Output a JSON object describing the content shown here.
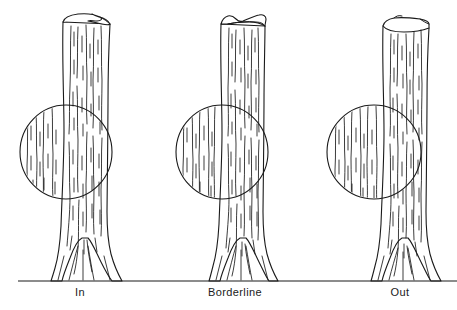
{
  "figure": {
    "background_color": "#ffffff",
    "ink_color": "#1a1a1a",
    "width": 457,
    "height": 310
  },
  "ground": {
    "name": "ground-line",
    "y": 281,
    "x1": 18,
    "x2": 457
  },
  "panels": [
    {
      "id": "in",
      "label": "In",
      "label_x": 80,
      "label_y": 296,
      "trunk": {
        "top_y": 18,
        "top_left_x": 62,
        "top_right_x": 110,
        "base_left_x": 55,
        "base_right_x": 120,
        "base_y": 281
      },
      "gauge": {
        "cx": 66,
        "cy": 152,
        "rx": 46,
        "ry": 47
      },
      "tally_state": "in",
      "description": "Tree trunk wider than the gauge angle at the circle - counted In"
    },
    {
      "id": "borderline",
      "label": "Borderline",
      "label_x": 235,
      "label_y": 296,
      "trunk": {
        "top_y": 20,
        "top_left_x": 220,
        "top_right_x": 264,
        "base_left_x": 212,
        "base_right_x": 276,
        "base_y": 281
      },
      "gauge": {
        "cx": 222,
        "cy": 152,
        "rx": 46,
        "ry": 47
      },
      "tally_state": "borderline",
      "description": "Tree trunk exactly fills the gauge angle - counted Borderline"
    },
    {
      "id": "out",
      "label": "Out",
      "label_x": 400,
      "label_y": 296,
      "trunk": {
        "top_y": 22,
        "top_left_x": 382,
        "top_right_x": 428,
        "base_left_x": 374,
        "base_right_x": 440,
        "base_y": 281
      },
      "gauge": {
        "cx": 374,
        "cy": 152,
        "rx": 47,
        "ry": 47
      },
      "tally_state": "out",
      "description": "Tree trunk narrower than the gauge angle - counted Out"
    }
  ]
}
